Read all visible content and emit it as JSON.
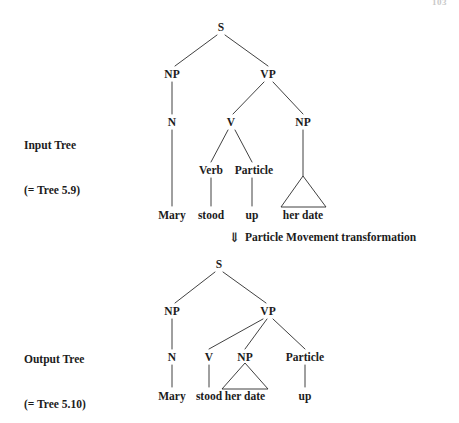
{
  "figure": {
    "page_number": "103",
    "transformation_note": {
      "arrow_icon": "double-down-arrow",
      "arrow_glyph": "⇓",
      "text": "Particle Movement transformation"
    },
    "labels": {
      "input_tree_line1": "Input Tree",
      "input_tree_line2": "(= Tree 5.9)",
      "output_tree_line1": "Output Tree",
      "output_tree_line2": "(= Tree 5.10)"
    }
  },
  "input_tree": {
    "nodes": {
      "s": "S",
      "np_subject": "NP",
      "vp": "VP",
      "n": "N",
      "v": "V",
      "np_object": "NP",
      "verb": "Verb",
      "particle": "Particle"
    },
    "terminals": {
      "mary": "Mary",
      "stood": "stood",
      "up": "up",
      "her_date": "her date"
    },
    "sentence": "Mary stood up her date"
  },
  "output_tree": {
    "nodes": {
      "s": "S",
      "np_subject": "NP",
      "vp": "VP",
      "n": "N",
      "v": "V",
      "np_object": "NP",
      "particle": "Particle"
    },
    "terminals": {
      "mary": "Mary",
      "stood": "stood",
      "her_date": "her date",
      "up": "up"
    },
    "sentence": "Mary stood her date up"
  }
}
